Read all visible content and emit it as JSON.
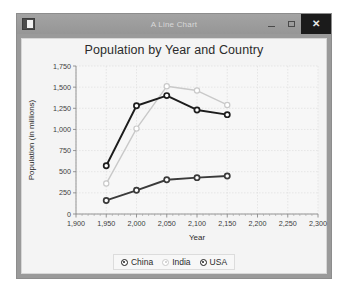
{
  "window": {
    "title": "A Line Chart",
    "icon": "app-window-icon",
    "buttons": {
      "minimize": "–",
      "maximize": "□",
      "close": "✕"
    }
  },
  "chart_data": {
    "type": "line",
    "title": "Population by Year and Country",
    "xlabel": "Year",
    "ylabel": "Population (in millions)",
    "xlim": [
      1900,
      2300
    ],
    "ylim": [
      0,
      1750
    ],
    "xticks": [
      1900,
      1950,
      2000,
      2050,
      2100,
      2150,
      2200,
      2250,
      2300
    ],
    "xticklabels": [
      "1,900",
      "1,950",
      "2,000",
      "2,050",
      "2,100",
      "2,150",
      "2,200",
      "2,250",
      "2,300"
    ],
    "yticks": [
      0,
      250,
      500,
      750,
      1000,
      1250,
      1500,
      1750
    ],
    "yticklabels": [
      "0",
      "250",
      "500",
      "750",
      "1,000",
      "1,250",
      "1,500",
      "1,750"
    ],
    "grid": true,
    "legend_position": "bottom",
    "x": [
      1950,
      2000,
      2050,
      2100,
      2150
    ],
    "series": [
      {
        "name": "China",
        "color": "#1d1d1d",
        "values": [
          570,
          1280,
          1400,
          1230,
          1175
        ]
      },
      {
        "name": "India",
        "color": "#c9c9c9",
        "values": [
          360,
          1010,
          1510,
          1460,
          1290
        ]
      },
      {
        "name": "USA",
        "color": "#3a3a3a",
        "values": [
          160,
          280,
          405,
          430,
          450
        ]
      }
    ]
  }
}
